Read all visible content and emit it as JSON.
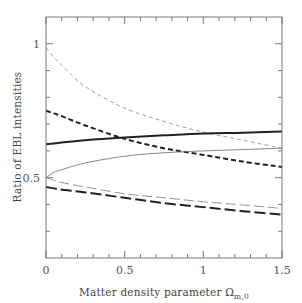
{
  "chart_data": {
    "type": "line",
    "title": "",
    "xlabel": "Matter density parameter Ω",
    "xlabel_subscript": "m,0",
    "ylabel": "Ratio of EBL intensities",
    "xlim": [
      0,
      1.5
    ],
    "ylim": [
      0.2,
      1.1
    ],
    "x_ticks_major": [
      0,
      0.5,
      1,
      1.5
    ],
    "x_tick_labels": [
      "0",
      "0.5",
      "1",
      "1.5"
    ],
    "x_minor_step": 0.1,
    "y_ticks_major": [
      0.5,
      1
    ],
    "y_tick_labels": [
      "0.5",
      "1"
    ],
    "y_minor_step": 0.1,
    "grid": false,
    "legend": null,
    "x": [
      0,
      0.05,
      0.1,
      0.25,
      0.5,
      0.75,
      1.0,
      1.25,
      1.5
    ],
    "series": [
      {
        "name": "thin dashed",
        "style": "thin-dashed",
        "color": "#888888",
        "values": [
          0.985,
          0.95,
          0.92,
          0.84,
          0.76,
          0.71,
          0.67,
          0.64,
          0.61
        ]
      },
      {
        "name": "thick dashed",
        "style": "thick-dashed",
        "color": "#222222",
        "values": [
          0.75,
          0.74,
          0.73,
          0.695,
          0.645,
          0.61,
          0.585,
          0.56,
          0.54
        ]
      },
      {
        "name": "thick solid",
        "style": "thick-solid",
        "color": "#222222",
        "values": [
          0.625,
          0.628,
          0.631,
          0.64,
          0.65,
          0.658,
          0.665,
          0.668,
          0.672
        ]
      },
      {
        "name": "thin solid",
        "style": "thin-solid",
        "color": "#777777",
        "values": [
          0.5,
          0.52,
          0.53,
          0.555,
          0.58,
          0.593,
          0.6,
          0.605,
          0.61
        ]
      },
      {
        "name": "thin long-dashed",
        "style": "thin-longdash",
        "color": "#888888",
        "values": [
          0.5,
          0.49,
          0.482,
          0.465,
          0.44,
          0.425,
          0.41,
          0.398,
          0.385
        ]
      },
      {
        "name": "thick long-dashed",
        "style": "thick-longdash",
        "color": "#222222",
        "values": [
          0.465,
          0.46,
          0.455,
          0.445,
          0.425,
          0.405,
          0.39,
          0.375,
          0.362
        ]
      }
    ]
  }
}
